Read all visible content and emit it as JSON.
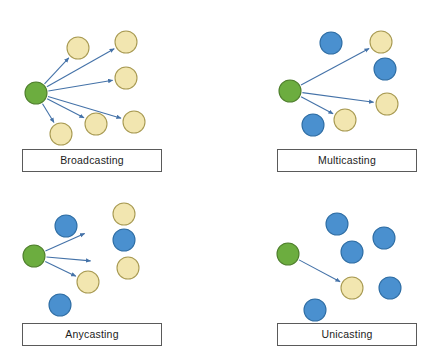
{
  "canvas": {
    "width": 429,
    "height": 347,
    "background": "#ffffff"
  },
  "colors": {
    "source_fill": "#6CAD3F",
    "source_stroke": "#4E7F2C",
    "target_fill": "#F2E6B0",
    "target_stroke": "#A89A52",
    "idle_fill": "#4A90CF",
    "idle_stroke": "#2E6DA4",
    "arrow": "#4472A8",
    "box_border": "#5a5a5a",
    "label_text": "#1c1c1c"
  },
  "node_radius": 11,
  "panels": [
    {
      "id": "broadcasting",
      "label": "Broadcasting",
      "label_box": {
        "x": 22,
        "y": 149,
        "width": 140,
        "height": 23
      },
      "nodes": [
        {
          "name": "source-node",
          "role": "source",
          "cx": 36,
          "cy": 93
        },
        {
          "name": "target-node-1",
          "role": "target",
          "cx": 78,
          "cy": 48
        },
        {
          "name": "target-node-2",
          "role": "target",
          "cx": 126,
          "cy": 42
        },
        {
          "name": "target-node-3",
          "role": "target",
          "cx": 126,
          "cy": 78
        },
        {
          "name": "target-node-4",
          "role": "target",
          "cx": 134,
          "cy": 122
        },
        {
          "name": "target-node-5",
          "role": "target",
          "cx": 96,
          "cy": 124
        },
        {
          "name": "target-node-6",
          "role": "target",
          "cx": 61,
          "cy": 134
        }
      ],
      "arrows": [
        {
          "name": "arrow-to-target-1",
          "x1": 36,
          "y1": 93,
          "x2": 78,
          "y2": 48
        },
        {
          "name": "arrow-to-target-2",
          "x1": 36,
          "y1": 93,
          "x2": 126,
          "y2": 42
        },
        {
          "name": "arrow-to-target-3",
          "x1": 36,
          "y1": 93,
          "x2": 126,
          "y2": 78
        },
        {
          "name": "arrow-to-target-4",
          "x1": 36,
          "y1": 93,
          "x2": 134,
          "y2": 122
        },
        {
          "name": "arrow-to-target-5",
          "x1": 36,
          "y1": 93,
          "x2": 96,
          "y2": 124
        },
        {
          "name": "arrow-to-target-6",
          "x1": 36,
          "y1": 93,
          "x2": 61,
          "y2": 134
        }
      ]
    },
    {
      "id": "multicasting",
      "label": "Multicasting",
      "label_box": {
        "x": 277,
        "y": 149,
        "width": 140,
        "height": 23
      },
      "nodes": [
        {
          "name": "source-node",
          "role": "source",
          "cx": 290,
          "cy": 91
        },
        {
          "name": "target-node-1",
          "role": "target",
          "cx": 381,
          "cy": 42
        },
        {
          "name": "target-node-2",
          "role": "target",
          "cx": 387,
          "cy": 104
        },
        {
          "name": "target-node-3",
          "role": "target",
          "cx": 345,
          "cy": 120
        },
        {
          "name": "idle-node-1",
          "role": "idle",
          "cx": 331,
          "cy": 43
        },
        {
          "name": "idle-node-2",
          "role": "idle",
          "cx": 385,
          "cy": 69
        },
        {
          "name": "idle-node-3",
          "role": "idle",
          "cx": 313,
          "cy": 125
        }
      ],
      "arrows": [
        {
          "name": "arrow-to-target-1",
          "x1": 290,
          "y1": 91,
          "x2": 381,
          "y2": 42
        },
        {
          "name": "arrow-to-target-2",
          "x1": 290,
          "y1": 91,
          "x2": 387,
          "y2": 104
        },
        {
          "name": "arrow-to-target-3",
          "x1": 290,
          "y1": 91,
          "x2": 345,
          "y2": 120
        }
      ]
    },
    {
      "id": "anycasting",
      "label": "Anycasting",
      "label_box": {
        "x": 22,
        "y": 323,
        "width": 140,
        "height": 23
      },
      "nodes": [
        {
          "name": "source-node",
          "role": "source",
          "cx": 34,
          "cy": 256
        },
        {
          "name": "target-node-1",
          "role": "target",
          "cx": 88,
          "cy": 282
        },
        {
          "name": "idle-node-1",
          "role": "idle",
          "cx": 66,
          "cy": 226
        },
        {
          "name": "idle-node-2",
          "role": "idle",
          "cx": 124,
          "cy": 240
        },
        {
          "name": "target-node-2",
          "role": "target",
          "cx": 124,
          "cy": 214
        },
        {
          "name": "target-node-3",
          "role": "target",
          "cx": 128,
          "cy": 268
        },
        {
          "name": "idle-node-3",
          "role": "idle",
          "cx": 60,
          "cy": 305
        }
      ],
      "arrows": [
        {
          "name": "arrow-upper",
          "x1": 34,
          "y1": 256,
          "x2": 97,
          "y2": 228
        },
        {
          "name": "arrow-middle",
          "x1": 34,
          "y1": 256,
          "x2": 104,
          "y2": 262
        },
        {
          "name": "arrow-to-target-1",
          "x1": 34,
          "y1": 256,
          "x2": 88,
          "y2": 282
        }
      ]
    },
    {
      "id": "unicasting",
      "label": "Unicasting",
      "label_box": {
        "x": 277,
        "y": 323,
        "width": 140,
        "height": 23
      },
      "nodes": [
        {
          "name": "source-node",
          "role": "source",
          "cx": 288,
          "cy": 254
        },
        {
          "name": "target-node-1",
          "role": "target",
          "cx": 352,
          "cy": 288
        },
        {
          "name": "idle-node-1",
          "role": "idle",
          "cx": 337,
          "cy": 224
        },
        {
          "name": "idle-node-2",
          "role": "idle",
          "cx": 352,
          "cy": 252
        },
        {
          "name": "idle-node-3",
          "role": "idle",
          "cx": 384,
          "cy": 238
        },
        {
          "name": "idle-node-4",
          "role": "idle",
          "cx": 390,
          "cy": 288
        },
        {
          "name": "idle-node-5",
          "role": "idle",
          "cx": 315,
          "cy": 310
        }
      ],
      "arrows": [
        {
          "name": "arrow-to-target-1",
          "x1": 288,
          "y1": 254,
          "x2": 352,
          "y2": 288
        }
      ]
    }
  ]
}
